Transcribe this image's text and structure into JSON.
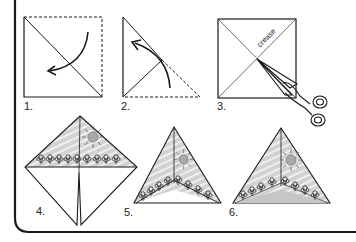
{
  "diagram": {
    "type": "origami-instructions",
    "colors": {
      "line": "#1a1a1a",
      "fill_gray": "#d4d4d4",
      "sun": "#a8a8a8",
      "stripe": "#f0f0f0"
    },
    "steps": [
      {
        "number": "1.",
        "description": "square with diagonal fold, dashed outline, curved arrow"
      },
      {
        "number": "2.",
        "description": "triangle folded again, dashed edge, curved arrow"
      },
      {
        "number": "3.",
        "description": "square with crease lines cut with scissors",
        "annotation": "crease"
      },
      {
        "number": "4.",
        "description": "decorated diamond with sun and flowers, slit at bottom"
      },
      {
        "number": "5.",
        "description": "folded pyramid with decoration"
      },
      {
        "number": "6.",
        "description": "finished pyramid with shading"
      }
    ]
  }
}
